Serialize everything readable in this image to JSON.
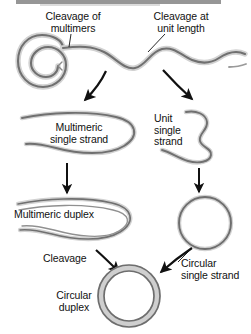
{
  "figure": {
    "background_color": "#ffffff",
    "dna_color": "#6e6e6e",
    "dna_highlight_color": "#d0d0d0",
    "arrow_color": "#111111",
    "text_color": "#111111",
    "width": 251,
    "height": 334
  },
  "labels": {
    "cleavage_of_multimers": "Cleavage of\nmultimers",
    "cleavage_at_unit_length": "Cleavage at\nunit length",
    "multimeric_single_strand": "Multimeric\nsingle strand",
    "unit_single_strand": "Unit\nsingle\nstrand",
    "multimeric_duplex": "Multimeric duplex",
    "cleavage": "Cleavage",
    "circular_single_strand": "Circular\nsingle strand",
    "circular_duplex": "Circular\nduplex"
  },
  "nodes": [
    {
      "id": "rolling-circle",
      "name": "Rolling circle with displaced wavy tail",
      "shape": "spiral-coil-with-wavy-strand",
      "strand_type": "single",
      "x": 14,
      "y": 38,
      "width": 232,
      "height": 62
    },
    {
      "id": "multimeric-single-strand",
      "name": "Multimeric single strand",
      "shape": "open-loop",
      "strand_type": "single",
      "x": 20,
      "y": 112,
      "width": 112,
      "height": 48
    },
    {
      "id": "unit-single-strand",
      "name": "Unit single strand",
      "shape": "open-hook",
      "strand_type": "single",
      "x": 182,
      "y": 110,
      "width": 48,
      "height": 52
    },
    {
      "id": "multimeric-duplex",
      "name": "Multimeric duplex",
      "shape": "open-loop",
      "strand_type": "duplex",
      "x": 14,
      "y": 196,
      "width": 116,
      "height": 48
    },
    {
      "id": "circular-single-strand",
      "name": "Circular single strand",
      "shape": "circle",
      "strand_type": "single",
      "cx": 205,
      "cy": 223,
      "r": 26
    },
    {
      "id": "circular-duplex",
      "name": "Circular duplex",
      "shape": "circle",
      "strand_type": "duplex",
      "cx": 129,
      "cy": 296,
      "r": 28
    }
  ],
  "arrows": [
    {
      "id": "arrow-multimer-branch",
      "from": "rolling-circle",
      "to": "multimeric-single-strand",
      "style": "curved"
    },
    {
      "id": "arrow-unit-branch",
      "from": "rolling-circle",
      "to": "unit-single-strand",
      "style": "curved"
    },
    {
      "id": "arrow-mss-to-duplex",
      "from": "multimeric-single-strand",
      "to": "multimeric-duplex",
      "style": "straight-down"
    },
    {
      "id": "arrow-uss-to-circle",
      "from": "unit-single-strand",
      "to": "circular-single-strand",
      "style": "straight-down"
    },
    {
      "id": "arrow-duplex-to-circular-duplex",
      "from": "multimeric-duplex",
      "to": "circular-duplex",
      "style": "curved",
      "label": "Cleavage"
    },
    {
      "id": "arrow-circle-to-circular-duplex",
      "from": "circular-single-strand",
      "to": "circular-duplex",
      "style": "curved"
    }
  ],
  "leaders": [
    {
      "id": "leader-cleavage-of-multimers",
      "label": "Cleavage of multimers"
    },
    {
      "id": "leader-cleavage-at-unit-length",
      "label": "Cleavage at unit length"
    },
    {
      "id": "leader-circular-single-strand",
      "label": "Circular single strand"
    }
  ]
}
